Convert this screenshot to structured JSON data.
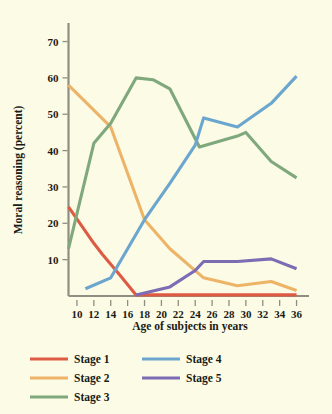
{
  "chart_data": {
    "type": "line",
    "title": "",
    "subtitle": "",
    "xlabel": "Age of subjects in years",
    "ylabel": "Moral reasoning (percent)",
    "xlim": [
      9,
      37
    ],
    "ylim": [
      0,
      74
    ],
    "grid": false,
    "legend_position": "bottom-left",
    "x_ticks": [
      10,
      12,
      14,
      16,
      18,
      20,
      22,
      24,
      26,
      28,
      30,
      32,
      34,
      36
    ],
    "x_tick_labels": [
      "10",
      "12",
      "14",
      "16",
      "18",
      "20",
      "22",
      "24",
      "26",
      "28",
      "30",
      "32",
      "34",
      "36"
    ],
    "y_ticks": [
      10,
      20,
      30,
      40,
      50,
      60,
      70
    ],
    "y_tick_labels": [
      "10",
      "20",
      "30",
      "40",
      "50",
      "60",
      "70"
    ],
    "series": [
      {
        "name": "Stage 1",
        "color": "#de5b43",
        "x": [
          9,
          12,
          13,
          15,
          17,
          21,
          25,
          29,
          33,
          36
        ],
        "values": [
          24.5,
          14.5,
          11.5,
          6,
          0.3,
          0.3,
          0.3,
          0.3,
          0.3,
          0.3
        ]
      },
      {
        "name": "Stage 2",
        "color": "#edb468",
        "x": [
          9,
          14,
          18,
          21,
          24,
          25,
          29,
          33,
          36
        ],
        "values": [
          58,
          46.5,
          21,
          13,
          7,
          5,
          2.8,
          4,
          1.5
        ]
      },
      {
        "name": "Stage 3",
        "color": "#7fa87c",
        "x": [
          9,
          12,
          14,
          17,
          19,
          21,
          24.5,
          29,
          30,
          33,
          36
        ],
        "values": [
          13,
          42,
          47.5,
          60,
          59.5,
          57,
          41,
          44,
          45,
          37,
          32.5
        ]
      },
      {
        "name": "Stage 4",
        "color": "#6ba6cf",
        "x": [
          11,
          14,
          18,
          21,
          24,
          25,
          29,
          33,
          36
        ],
        "values": [
          2,
          5,
          21,
          31,
          41.5,
          49,
          46.5,
          53,
          60.5
        ]
      },
      {
        "name": "Stage 5",
        "color": "#7b6cb3",
        "x": [
          17,
          21,
          24,
          25,
          29,
          33,
          36
        ],
        "values": [
          0.3,
          2.5,
          7,
          9.5,
          9.5,
          10.2,
          7.5
        ]
      }
    ]
  },
  "axis": {
    "y_title": "Moral reasoning (percent)",
    "x_title": "Age of subjects in years"
  },
  "legend": {
    "items": [
      {
        "label": "Stage 1",
        "color": "#de5b43"
      },
      {
        "label": "Stage 2",
        "color": "#edb468"
      },
      {
        "label": "Stage 3",
        "color": "#7fa87c"
      },
      {
        "label": "Stage 4",
        "color": "#6ba6cf"
      },
      {
        "label": "Stage 5",
        "color": "#7b6cb3"
      }
    ]
  },
  "colors": {
    "background": "#fcfbe6",
    "axis": "#8e8e82",
    "text": "#1a1a14"
  }
}
